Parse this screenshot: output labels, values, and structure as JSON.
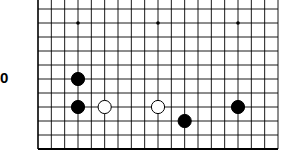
{
  "diagram": {
    "row_label": "0",
    "board_size": 19,
    "visible_rows": 11,
    "colors": {
      "background": "#ffffff",
      "grid_line": "#000000",
      "black_stone": "#000000",
      "white_stone": "#ffffff",
      "white_stone_outline": "#000000"
    },
    "star_points": [
      {
        "col": 3,
        "row": 1
      },
      {
        "col": 9,
        "row": 1
      },
      {
        "col": 15,
        "row": 1
      }
    ],
    "stones": [
      {
        "color": "black",
        "col": 3,
        "row": 5
      },
      {
        "color": "black",
        "col": 3,
        "row": 7
      },
      {
        "color": "white",
        "col": 5,
        "row": 7
      },
      {
        "color": "white",
        "col": 9,
        "row": 7
      },
      {
        "color": "black",
        "col": 11,
        "row": 8
      },
      {
        "color": "black",
        "col": 15,
        "row": 7
      }
    ]
  }
}
